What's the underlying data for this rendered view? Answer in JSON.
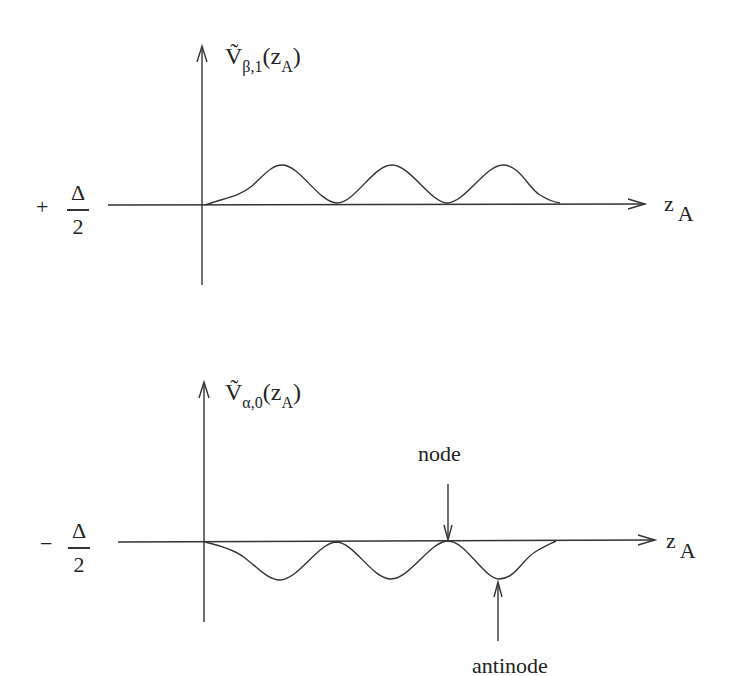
{
  "panels": [
    {
      "id": "upper",
      "function_main": "Ṽ",
      "function_sub": "β,1",
      "function_arg_open": "(z",
      "function_arg_sub": "A",
      "function_arg_close": ")",
      "level_sign": "+",
      "level_num": "Δ",
      "level_den": "2",
      "x_axis_label": "z",
      "x_axis_sub": "A"
    },
    {
      "id": "lower",
      "function_main": "Ṽ",
      "function_sub": "α,0",
      "function_arg_open": "(z",
      "function_arg_sub": "A",
      "function_arg_close": ")",
      "level_sign": "−",
      "level_num": "Δ",
      "level_den": "2",
      "x_axis_label": "z",
      "x_axis_sub": "A"
    }
  ],
  "annotations": {
    "node": "node",
    "antinode": "antinode"
  },
  "colors": {
    "stroke": "#333333",
    "background": "#ffffff"
  }
}
